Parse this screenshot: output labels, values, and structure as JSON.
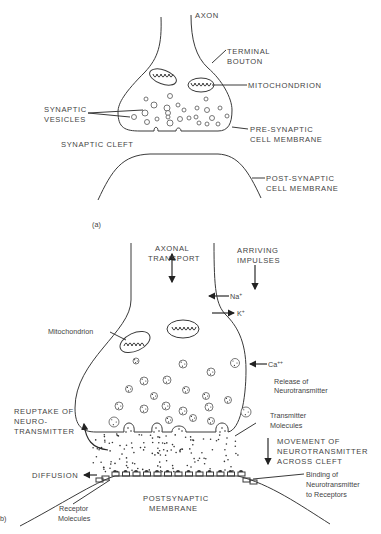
{
  "panel_a": {
    "label": "(a)",
    "labels": {
      "axon": "AXON",
      "terminal_bouton_1": "TERMINAL",
      "terminal_bouton_2": "BOUTON",
      "mitochondrion": "MITOCHONDRION",
      "synaptic_vesicles_1": "SYNAPTIC",
      "synaptic_vesicles_2": "VESICLES",
      "presynaptic_1": "PRE-SYNAPTIC",
      "presynaptic_2": "CELL MEMBRANE",
      "synaptic_cleft": "SYNAPTIC CLEFT",
      "postsynaptic_1": "POST-SYNAPTIC",
      "postsynaptic_2": "CELL MEMBRANE"
    }
  },
  "panel_b": {
    "label": "b)",
    "labels": {
      "axonal_transport_1": "AXONAL",
      "axonal_transport_2": "TRANSPORT",
      "arriving_impulses_1": "ARRIVING",
      "arriving_impulses_2": "IMPULSES",
      "na": "Na",
      "na_sup": "+",
      "k": "K",
      "k_sup": "+",
      "mitochondrion": "Mitochondrion",
      "ca": "Ca",
      "ca_sup": "++",
      "release_1": "Release of",
      "release_2": "Neurotransmitter",
      "reuptake_1": "REUPTAKE OF",
      "reuptake_2": "NEURO-",
      "reuptake_3": "TRANSMITTER",
      "transmitter_1": "Transmitter",
      "transmitter_2": "Molecules",
      "movement_1": "MOVEMENT OF",
      "movement_2": "NEUROTRANSMITTER",
      "movement_3": "ACROSS CLEFT",
      "diffusion": "DIFFUSION",
      "binding_1": "Binding of",
      "binding_2": "Neurotransmitter",
      "binding_3": "to Receptors",
      "receptor_1": "Receptor",
      "receptor_2": "Molecules",
      "postsynaptic_1": "POSTSYNAPTIC",
      "postsynaptic_2": "MEMBRANE"
    }
  }
}
